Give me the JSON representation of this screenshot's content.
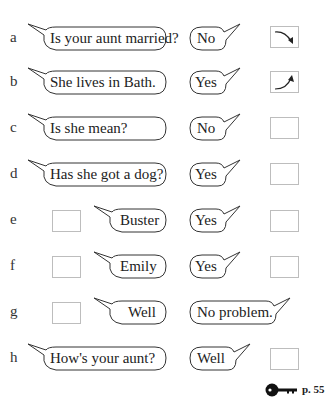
{
  "header": {
    "cut_off_instruction": ""
  },
  "exercise": {
    "rows": [
      {
        "letter": "a",
        "question": "Is your aunt married?",
        "answer": "No",
        "box_left": null,
        "box_right": "falling-intonation-arrow"
      },
      {
        "letter": "b",
        "question": "She lives in Bath.",
        "answer": "Yes",
        "box_left": null,
        "box_right": "rising-intonation-arrow"
      },
      {
        "letter": "c",
        "question": "Is she mean?",
        "answer": "No",
        "box_left": null,
        "box_right": "empty"
      },
      {
        "letter": "d",
        "question": "Has she got a dog?",
        "answer": "Yes",
        "box_left": null,
        "box_right": "empty"
      },
      {
        "letter": "e",
        "question": "Buster",
        "answer": "Yes",
        "box_left": "empty",
        "box_right": "empty"
      },
      {
        "letter": "f",
        "question": "Emily",
        "answer": "Yes",
        "box_left": "empty",
        "box_right": "empty"
      },
      {
        "letter": "g",
        "question": "Well",
        "answer": "No problem.",
        "box_left": "empty",
        "box_right": null
      },
      {
        "letter": "h",
        "question": "How's your aunt?",
        "answer": "Well",
        "box_left": null,
        "box_right": "empty"
      }
    ]
  },
  "footer": {
    "key_icon": "answer-key-icon",
    "page_reference": "p. 55"
  },
  "colors": {
    "ink": "#222222",
    "box_border": "#bdbdbd",
    "background": "#ffffff"
  }
}
